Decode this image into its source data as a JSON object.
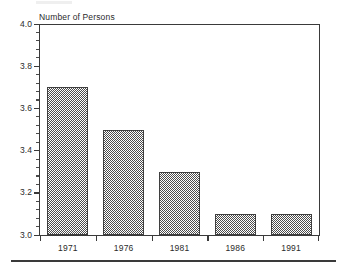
{
  "chart_data": {
    "type": "bar",
    "title": "Number of Persons",
    "xlabel": "",
    "ylabel": "Number of Persons",
    "categories": [
      "1971",
      "1976",
      "1981",
      "1986",
      "1991"
    ],
    "values": [
      3.7,
      3.5,
      3.3,
      3.1,
      3.1
    ],
    "series": [
      {
        "name": "Number of Persons",
        "values": [
          3.7,
          3.5,
          3.3,
          3.1,
          3.1
        ]
      }
    ],
    "ylim": [
      3.0,
      4.0
    ],
    "ytick_labels": [
      "4.0",
      "3.8",
      "3.6",
      "3.4",
      "3.2",
      "3.0"
    ],
    "ytick_values": [
      4.0,
      3.8,
      3.6,
      3.4,
      3.2,
      3.0
    ],
    "ytick_minor_step": 0.04,
    "grid": false,
    "legend": null,
    "legend_position": "none",
    "bar_color": "#4d4d4d",
    "bar_fill_style": "checkerboard-dither",
    "axis_color": "#3a3a3a",
    "background_color": "#ffffff"
  }
}
